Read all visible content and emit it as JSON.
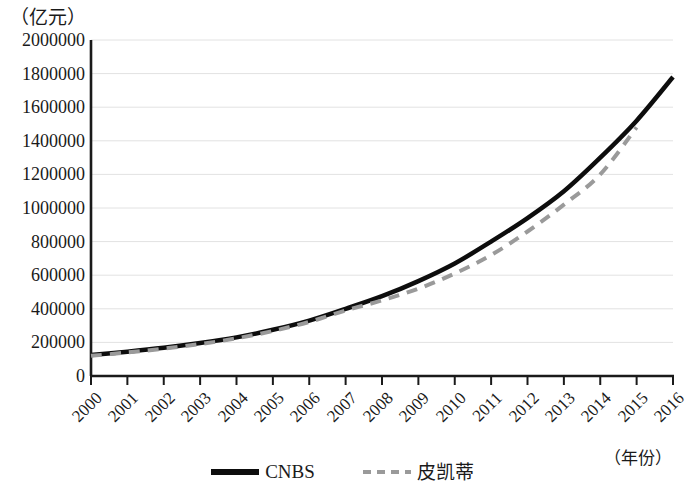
{
  "chart_data": {
    "type": "line",
    "title": "",
    "subtitle": "",
    "xlabel": "（年份）",
    "ylabel": "（亿元）",
    "x": [
      2000,
      2001,
      2002,
      2003,
      2004,
      2005,
      2006,
      2007,
      2008,
      2009,
      2010,
      2011,
      2012,
      2013,
      2014,
      2015,
      2016
    ],
    "categories": [
      "2000",
      "2001",
      "2002",
      "2003",
      "2004",
      "2005",
      "2006",
      "2007",
      "2008",
      "2009",
      "2010",
      "2011",
      "2012",
      "2013",
      "2014",
      "2015",
      "2016"
    ],
    "xlim": [
      2000,
      2016
    ],
    "ylim": [
      0,
      2000000
    ],
    "yticks": [
      0,
      200000,
      400000,
      600000,
      800000,
      1000000,
      1200000,
      1400000,
      1600000,
      1800000,
      2000000
    ],
    "ytick_labels": [
      "0",
      "200000",
      "400000",
      "600000",
      "800000",
      "1000000",
      "1200000",
      "1400000",
      "1600000",
      "1800000",
      "2000000"
    ],
    "grid": "horizontal",
    "legend_position": "bottom-center",
    "series": [
      {
        "name": "CNBS",
        "style": "solid",
        "color": "#0d0d0d",
        "width": 4.5,
        "values": [
          125000,
          145000,
          168000,
          196000,
          230000,
          275000,
          330000,
          400000,
          475000,
          565000,
          670000,
          800000,
          940000,
          1100000,
          1300000,
          1520000,
          1780000
        ]
      },
      {
        "name": "皮凯蒂",
        "style": "dashed",
        "color": "#9a9a9a",
        "width": 4,
        "values": [
          120000,
          140000,
          163000,
          190000,
          224000,
          268000,
          322000,
          390000,
          450000,
          520000,
          610000,
          720000,
          860000,
          1020000,
          1200000,
          1480000,
          null
        ]
      }
    ],
    "annotations": []
  },
  "legend": {
    "entries": [
      {
        "label": "CNBS",
        "style": "solid",
        "color": "#0d0d0d"
      },
      {
        "label": "皮凯蒂",
        "style": "dashed",
        "color": "#9a9a9a"
      }
    ]
  },
  "axes": {
    "y_unit_label": "（亿元）",
    "x_unit_label": "（年份）"
  },
  "colors": {
    "axis": "#1a1a1a",
    "grid": "#e2e2e2",
    "series_cnbs": "#0d0d0d",
    "series_piketty": "#9a9a9a",
    "background": "#ffffff"
  }
}
